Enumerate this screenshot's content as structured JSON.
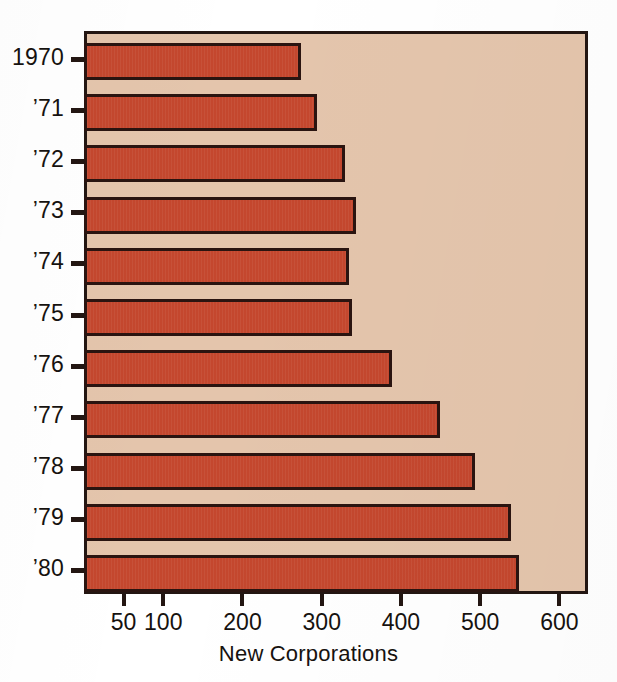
{
  "top_fragment": "",
  "chart_data": {
    "type": "bar",
    "orientation": "horizontal",
    "title": "",
    "xlabel": "New Corporations",
    "ylabel": "",
    "categories": [
      "1970",
      "’71",
      "’72",
      "’73",
      "’74",
      "’75",
      "’76",
      "’77",
      "’78",
      "’79",
      "’80"
    ],
    "values": [
      270,
      290,
      325,
      340,
      330,
      335,
      385,
      445,
      490,
      535,
      545
    ],
    "series": [
      {
        "name": "New Corporations",
        "values": [
          270,
          290,
          325,
          340,
          330,
          335,
          385,
          445,
          490,
          535,
          545
        ]
      }
    ],
    "xlim": [
      0,
      636
    ],
    "xticks": [
      50,
      100,
      200,
      300,
      400,
      500,
      600
    ],
    "xtick_labels": [
      "50",
      "100",
      "200",
      "300",
      "400",
      "500",
      "600"
    ],
    "grid": false,
    "legend": null,
    "colors": {
      "bar_fill": "#c4472e",
      "bar_edge": "#2a1410",
      "plot_background": "#e4c5ac",
      "axis": "#231612",
      "text": "#16120f",
      "page_background": "#ffffff"
    }
  }
}
